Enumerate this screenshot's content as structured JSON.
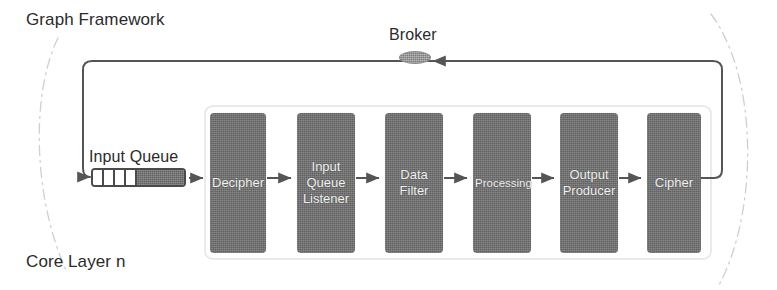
{
  "diagram": {
    "title": "Graph Framework",
    "layer_label": "Core Layer n",
    "broker_label": "Broker",
    "input_queue_label": "Input Queue",
    "colors": {
      "box_fill": "#6d6d6d",
      "box_text": "#f2f2f2",
      "line": "#555555",
      "container_border": "#d8d8d8",
      "boundary_arc": "#cccccc",
      "page_text": "#2b2b2b",
      "background": "#ffffff"
    },
    "pipeline": [
      {
        "id": "decipher",
        "label": "Decipher",
        "lines": [
          "Decipher"
        ],
        "x": 210,
        "y": 113,
        "w": 56,
        "h": 140,
        "small": false
      },
      {
        "id": "input-queue-listener",
        "label": "Input Queue Listener",
        "lines": [
          "Input",
          "Queue",
          "Listener"
        ],
        "x": 297,
        "y": 113,
        "w": 58,
        "h": 140,
        "small": false
      },
      {
        "id": "data-filter",
        "label": "Data Filter",
        "lines": [
          "Data",
          "Filter"
        ],
        "x": 385,
        "y": 113,
        "w": 58,
        "h": 140,
        "small": false
      },
      {
        "id": "processing",
        "label": "Processing",
        "lines": [
          "Processing"
        ],
        "x": 473,
        "y": 113,
        "w": 58,
        "h": 140,
        "small": true
      },
      {
        "id": "output-producer",
        "label": "Output Producer",
        "lines": [
          "Output",
          "Producer"
        ],
        "x": 560,
        "y": 113,
        "w": 58,
        "h": 140,
        "small": false
      },
      {
        "id": "cipher",
        "label": "Cipher",
        "lines": [
          "Cipher"
        ],
        "x": 647,
        "y": 113,
        "w": 54,
        "h": 140,
        "small": false
      }
    ],
    "queue_cells": 4,
    "connectors": [
      {
        "id": "feedback-into-queue",
        "from": "broker-loop",
        "to": "input-queue",
        "kind": "arrow"
      },
      {
        "id": "queue-to-decipher",
        "from": "input-queue",
        "to": "decipher",
        "kind": "arrow"
      },
      {
        "id": "decipher-to-listener",
        "from": "decipher",
        "to": "input-queue-listener",
        "kind": "arrow"
      },
      {
        "id": "listener-to-filter",
        "from": "input-queue-listener",
        "to": "data-filter",
        "kind": "arrow"
      },
      {
        "id": "filter-to-processing",
        "from": "data-filter",
        "to": "processing",
        "kind": "arrow"
      },
      {
        "id": "processing-to-output",
        "from": "processing",
        "to": "output-producer",
        "kind": "arrow"
      },
      {
        "id": "output-to-cipher",
        "from": "output-producer",
        "to": "cipher",
        "kind": "arrow"
      },
      {
        "id": "cipher-to-broker",
        "from": "cipher",
        "to": "broker",
        "kind": "arrow"
      }
    ]
  }
}
